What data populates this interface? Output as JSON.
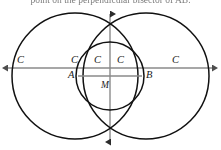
{
  "caption": {
    "text": "point on the perpendicular bisector of AB."
  },
  "figure": {
    "name": "two-intersecting-circles-perpendicular-bisector-diagram",
    "colors": {
      "circle_stroke": "#111111",
      "axis_stroke": "#8a8a8a",
      "label_color": "#1a1a1a",
      "background": "#ffffff"
    },
    "axes": {
      "horizontal": {
        "label": "horizontal-line-AB",
        "y": 68,
        "x_start": 8,
        "x_end": 213,
        "arrow_left": true,
        "arrow_right": true
      },
      "vertical": {
        "label": "vertical-perpendicular-bisector",
        "x": 110,
        "y_start": 14,
        "y_end": 142,
        "arrow_top": true,
        "arrow_bottom": true
      }
    },
    "circles": [
      {
        "name": "left-large-circle",
        "cx": 75,
        "cy": 76,
        "r": 63
      },
      {
        "name": "right-large-circle",
        "cx": 146,
        "cy": 76,
        "r": 63
      },
      {
        "name": "middle-small-circle",
        "cx": 110,
        "cy": 76,
        "r": 34
      }
    ],
    "segment": {
      "name": "segment-AB",
      "x1": 78,
      "x2": 142,
      "y": 76
    },
    "labels": [
      {
        "name": "label-c-far-left",
        "text": "C",
        "x": 17,
        "y": 55
      },
      {
        "name": "label-c-inner-left",
        "text": "C",
        "x": 71,
        "y": 55
      },
      {
        "name": "label-c-center-left",
        "text": "C",
        "x": 94,
        "y": 55
      },
      {
        "name": "label-c-center-right",
        "text": "C",
        "x": 117,
        "y": 55
      },
      {
        "name": "label-c-far-right",
        "text": "C",
        "x": 172,
        "y": 55
      },
      {
        "name": "label-point-a",
        "text": "A",
        "x": 68,
        "y": 70
      },
      {
        "name": "label-point-m",
        "text": "M",
        "x": 101,
        "y": 80
      },
      {
        "name": "label-point-b",
        "text": "B",
        "x": 146,
        "y": 70
      }
    ]
  }
}
